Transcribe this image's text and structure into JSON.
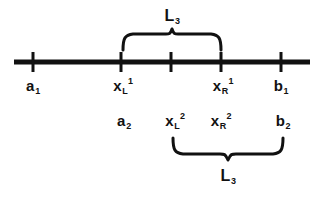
{
  "figure": {
    "type": "number-line-diagram",
    "colors": {
      "ink": "#111111",
      "background": "#ffffff"
    },
    "axis": {
      "name": "main-number-line",
      "x_start": 14,
      "x_end": 310,
      "y": 62,
      "thickness": 5,
      "ticks": [
        {
          "name": "tick-a1",
          "x": 33
        },
        {
          "name": "tick-xL1",
          "x": 121
        },
        {
          "name": "tick-middle",
          "x": 171
        },
        {
          "name": "tick-xR1",
          "x": 221
        },
        {
          "name": "tick-b1",
          "x": 281
        }
      ]
    },
    "labels_row1": [
      {
        "name": "label-a1",
        "base": "a",
        "sub": "1",
        "sup": "",
        "x": 33,
        "y": 78
      },
      {
        "name": "label-xL1",
        "base": "x",
        "sub": "L",
        "sup": "1",
        "x": 121,
        "y": 78
      },
      {
        "name": "label-xR1",
        "base": "x",
        "sub": "R",
        "sup": "1",
        "x": 221,
        "y": 78
      },
      {
        "name": "label-b1",
        "base": "b",
        "sub": "1",
        "sup": "",
        "x": 281,
        "y": 78
      }
    ],
    "labels_row2": [
      {
        "name": "label-a2",
        "base": "a",
        "sub": "2",
        "sup": "",
        "x": 124,
        "y": 113
      },
      {
        "name": "label-xL2",
        "base": "x",
        "sub": "L",
        "sup": "2",
        "x": 173,
        "y": 113
      },
      {
        "name": "label-xR2",
        "base": "x",
        "sub": "R",
        "sup": "2",
        "x": 219,
        "y": 113
      },
      {
        "name": "label-b2",
        "base": "b",
        "sub": "2",
        "sup": "",
        "x": 283,
        "y": 113
      }
    ],
    "braces": [
      {
        "name": "upper-brace",
        "orientation": "down",
        "x_left": 122,
        "x_right": 222,
        "label": {
          "base": "L",
          "sub": "3",
          "x": 172,
          "y": 8
        }
      },
      {
        "name": "lower-brace",
        "orientation": "up",
        "x_left": 172,
        "x_right": 283,
        "label": {
          "base": "L",
          "sub": "3",
          "x": 228,
          "y": 168
        }
      }
    ]
  }
}
